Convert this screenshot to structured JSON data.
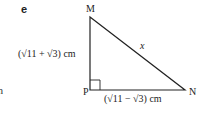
{
  "question_label": "e",
  "vertices": {
    "M": "M",
    "P": "P",
    "N": "N"
  },
  "sides": {
    "MP": "(√11 + √3) cm",
    "PN": "(√11 − √3) cm",
    "MN": "x"
  },
  "left_fragment": "n",
  "colors": {
    "line": "#222222"
  }
}
